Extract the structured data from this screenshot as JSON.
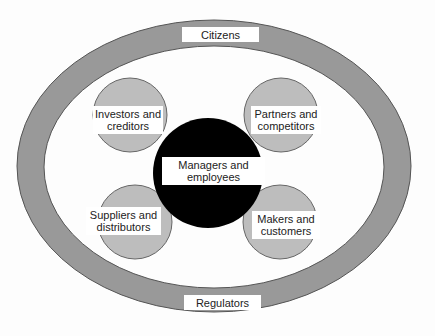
{
  "diagram": {
    "type": "stakeholder-ring",
    "outer_ring": {
      "top_label": "Citizens",
      "bottom_label": "Regulators",
      "color": "#999999"
    },
    "center": {
      "label_line1": "Managers and",
      "label_line2": "employees",
      "color": "#000000"
    },
    "satellites": [
      {
        "line1": "Investors and",
        "line2": "creditors",
        "position": "top-left"
      },
      {
        "line1": "Partners and",
        "line2": "competitors",
        "position": "top-right"
      },
      {
        "line1": "Suppliers and",
        "line2": "distributors",
        "position": "bottom-left"
      },
      {
        "line1": "Makers and",
        "line2": "customers",
        "position": "bottom-right"
      }
    ],
    "satellite_color": "#bdbdbd"
  }
}
